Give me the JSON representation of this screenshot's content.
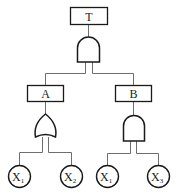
{
  "diagram": {
    "type": "fault-tree",
    "top_event": {
      "label": "T",
      "gate": "AND"
    },
    "intermediate_events": [
      {
        "label": "A",
        "gate": "OR",
        "inputs": [
          "X1",
          "X2"
        ]
      },
      {
        "label": "B",
        "gate": "AND",
        "inputs": [
          "X1",
          "X3"
        ]
      }
    ],
    "basic_events": [
      {
        "base": "X",
        "sub": "1",
        "parent": "A"
      },
      {
        "base": "X",
        "sub": "2",
        "parent": "A"
      },
      {
        "base": "X",
        "sub": "1",
        "parent": "B"
      },
      {
        "base": "X",
        "sub": "3",
        "parent": "B"
      }
    ]
  }
}
